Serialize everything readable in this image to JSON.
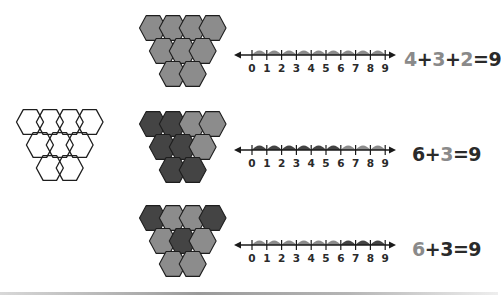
{
  "colors": {
    "light": "#8c8c8c",
    "dark": "#444444",
    "outline": "#1e1e1e",
    "empty": "#ffffff",
    "text_dark": "#2a2a2a",
    "text_light": "#8a8a8a"
  },
  "outline_figure": {
    "description": "9 unfilled hexagons in an inverted triangle (4-3-2)"
  },
  "rows": [
    {
      "hexagons": [
        "light",
        "light",
        "light",
        "light",
        "light",
        "light",
        "light",
        "light",
        "light"
      ],
      "number_line": {
        "ticks": [
          "0",
          "1",
          "2",
          "3",
          "4",
          "5",
          "6",
          "7",
          "8",
          "9"
        ],
        "jumps": [
          "light",
          "light",
          "light",
          "light",
          "light",
          "light",
          "light",
          "light",
          "light"
        ]
      },
      "equation": [
        {
          "text": "4",
          "tone": "light"
        },
        {
          "text": "+",
          "tone": "dark"
        },
        {
          "text": "3",
          "tone": "light"
        },
        {
          "text": "+",
          "tone": "dark"
        },
        {
          "text": "2",
          "tone": "light"
        },
        {
          "text": "=9",
          "tone": "dark"
        }
      ]
    },
    {
      "hexagons": [
        "dark",
        "dark",
        "light",
        "light",
        "dark",
        "dark",
        "light",
        "dark",
        "dark"
      ],
      "number_line": {
        "ticks": [
          "0",
          "1",
          "2",
          "3",
          "4",
          "5",
          "6",
          "7",
          "8",
          "9"
        ],
        "jumps": [
          "dark",
          "dark",
          "dark",
          "dark",
          "dark",
          "dark",
          "light",
          "light",
          "light"
        ]
      },
      "equation": [
        {
          "text": "6",
          "tone": "dark"
        },
        {
          "text": "+",
          "tone": "dark"
        },
        {
          "text": "3",
          "tone": "light"
        },
        {
          "text": "=9",
          "tone": "dark"
        }
      ]
    },
    {
      "hexagons": [
        "dark",
        "light",
        "light",
        "dark",
        "light",
        "dark",
        "light",
        "light",
        "light"
      ],
      "number_line": {
        "ticks": [
          "0",
          "1",
          "2",
          "3",
          "4",
          "5",
          "6",
          "7",
          "8",
          "9"
        ],
        "jumps": [
          "light",
          "light",
          "light",
          "light",
          "light",
          "light",
          "dark",
          "dark",
          "dark"
        ]
      },
      "equation": [
        {
          "text": "6",
          "tone": "light"
        },
        {
          "text": "+",
          "tone": "dark"
        },
        {
          "text": "3",
          "tone": "dark"
        },
        {
          "text": "=9",
          "tone": "dark"
        }
      ]
    }
  ]
}
